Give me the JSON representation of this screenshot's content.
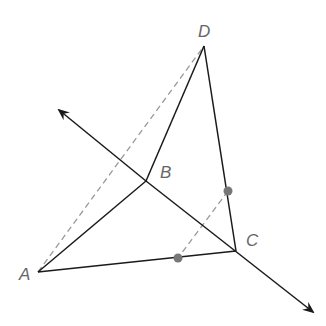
{
  "diagram": {
    "points": {
      "A": {
        "label": "A",
        "x": 38,
        "y": 272
      },
      "B": {
        "label": "B",
        "x": 146,
        "y": 181
      },
      "C": {
        "label": "C",
        "x": 236,
        "y": 251
      },
      "D": {
        "label": "D",
        "x": 204,
        "y": 46
      }
    },
    "solid_segments": [
      "AB",
      "BD",
      "DC",
      "AC"
    ],
    "dashed_segments": [
      "AD",
      "P1P2"
    ],
    "line": {
      "through": [
        "B",
        "C"
      ],
      "arrows": "both"
    },
    "dots": [
      {
        "x": 228,
        "y": 191
      },
      {
        "x": 178,
        "y": 258
      }
    ],
    "colors": {
      "line": "#1a1a1a",
      "dashed": "#999999",
      "dot": "#777777",
      "label": "#666666"
    }
  }
}
